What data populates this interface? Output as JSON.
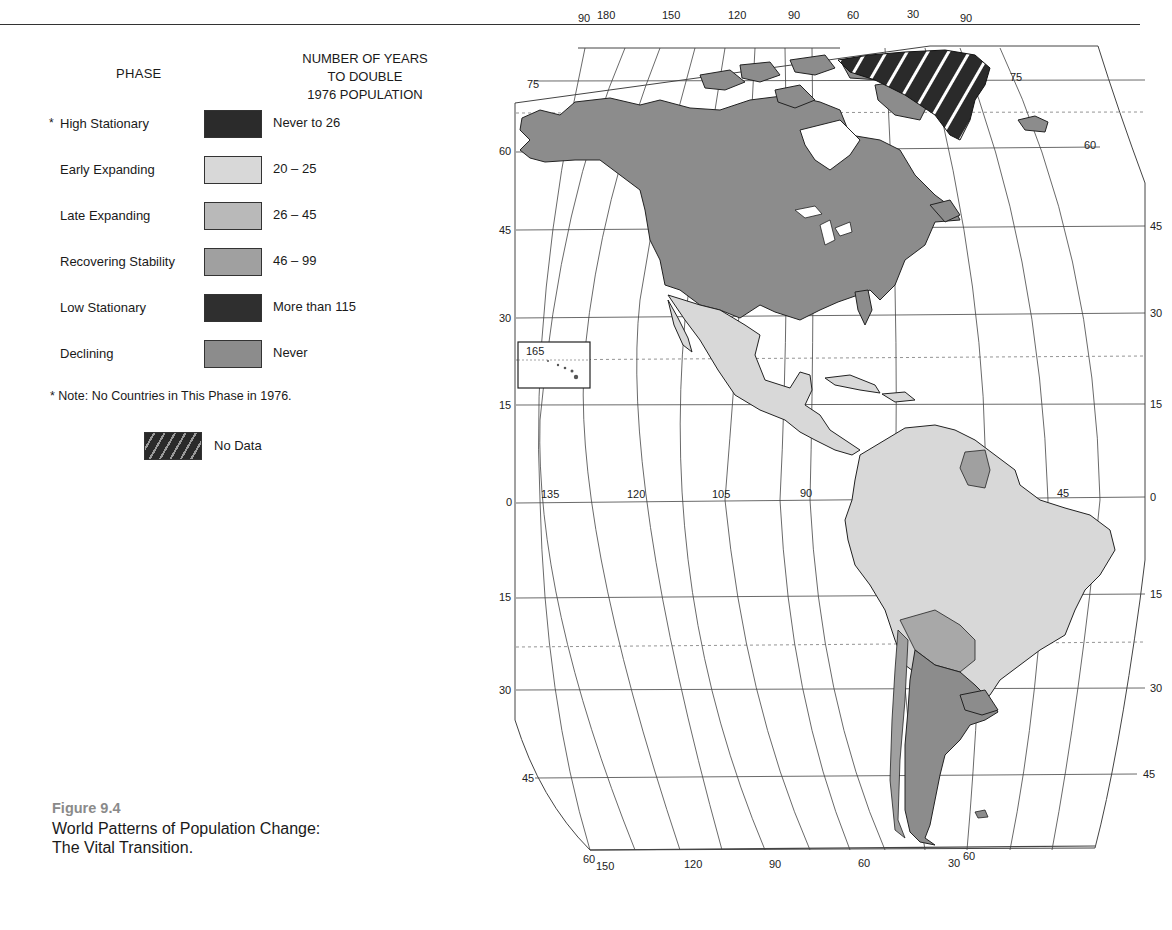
{
  "legend": {
    "header_phase": "PHASE",
    "header_years_lines": [
      "NUMBER OF YEARS",
      "TO DOUBLE",
      "1976 POPULATION"
    ],
    "items": [
      {
        "phase": "High Stationary",
        "marker": "*",
        "years": "Never to 26",
        "color": "#2b2b2b"
      },
      {
        "phase": "Early Expanding",
        "marker": "",
        "years": "20 – 25",
        "color": "#d8d8d8"
      },
      {
        "phase": "Late Expanding",
        "marker": "",
        "years": "26 – 45",
        "color": "#b9b9b9"
      },
      {
        "phase": "Recovering Stability",
        "marker": "",
        "years": "46 – 99",
        "color": "#a0a0a0"
      },
      {
        "phase": "Low Stationary",
        "marker": "",
        "years": "More than 115",
        "color": "#2f2f2f"
      },
      {
        "phase": "Declining",
        "marker": "",
        "years": "Never",
        "color": "#8c8c8c"
      }
    ],
    "note": "* Note:  No Countries in This Phase in 1976.",
    "no_data_label": "No Data"
  },
  "caption": {
    "figure_label": "Figure 9.4",
    "title_line1": "World Patterns of Population Change:",
    "title_line2": "The Vital Transition."
  },
  "map": {
    "region": "Americas",
    "top_longitude_labels": [
      "90",
      "180",
      "150",
      "120",
      "90",
      "60",
      "30",
      "90"
    ],
    "bottom_longitude_labels": [
      "60",
      "150",
      "120",
      "90",
      "60",
      "30",
      "60"
    ],
    "equator_longitude_labels": [
      "135",
      "120",
      "105",
      "90",
      "45"
    ],
    "left_latitude_labels": [
      "75",
      "60",
      "45",
      "30",
      "15",
      "0",
      "15",
      "30",
      "45"
    ],
    "right_latitude_labels": [
      "75",
      "60",
      "45",
      "30",
      "15",
      "0",
      "15",
      "30",
      "45"
    ],
    "inset_label": "165",
    "colors": {
      "north_america": "#8c8c8c",
      "greenland_no_data": "#2a2a2a",
      "latin_america": "#d8d8d8",
      "southern_cone": "#8c8c8c",
      "andes_mid": "#a8a8a8",
      "outline": "#222222",
      "graticule": "#444444"
    }
  }
}
